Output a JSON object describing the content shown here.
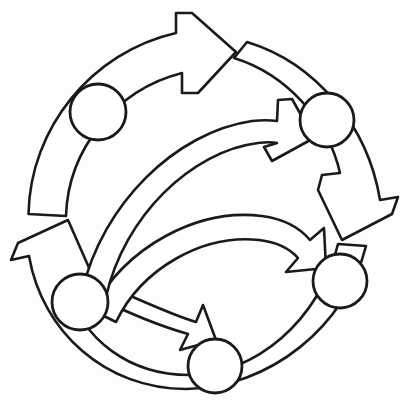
{
  "diagram": {
    "title": "Cyclic process diagram",
    "type": "circular-flow",
    "background_color": "#fdfdfd",
    "stroke_color": "#1a1a1a",
    "fill_color": "#ffffff",
    "stroke_width": 2.6,
    "canvas": {
      "width": 410,
      "height": 420
    },
    "center": {
      "x": 207,
      "y": 208
    },
    "outer_ring": {
      "direction": "clockwise",
      "arrow_count": 3,
      "radius_outer": 180,
      "radius_inner": 143,
      "arrows": [
        {
          "name": "outer-arrow-top",
          "label": "",
          "start_angle_deg": 182,
          "end_angle_deg": 298,
          "head_position": {
            "x": 222,
            "y": 28
          },
          "head_direction": "clockwise-right"
        },
        {
          "name": "outer-arrow-right",
          "label": "",
          "start_angle_deg": 302,
          "end_angle_deg": 58,
          "head_position": {
            "x": 370,
            "y": 188
          },
          "head_direction": "clockwise-down"
        },
        {
          "name": "outer-arrow-bottom",
          "label": "",
          "start_angle_deg": 62,
          "end_angle_deg": 178,
          "head_position": {
            "x": 48,
            "y": 212
          },
          "head_direction": "clockwise-up"
        }
      ]
    },
    "nodes": [
      {
        "name": "node-upper-left",
        "label": "",
        "cx": 98,
        "cy": 112,
        "r": 28
      },
      {
        "name": "node-upper-right",
        "label": "",
        "cx": 327,
        "cy": 120,
        "r": 27
      },
      {
        "name": "node-lower-right",
        "label": "",
        "cx": 340,
        "cy": 281,
        "r": 27
      },
      {
        "name": "node-bottom",
        "label": "",
        "cx": 215,
        "cy": 366,
        "r": 27
      },
      {
        "name": "node-lower-left",
        "label": "",
        "cx": 80,
        "cy": 302,
        "r": 28
      }
    ],
    "inner_arrows": [
      {
        "name": "inner-arrow-upper",
        "label": "",
        "direction": "left-to-right",
        "tail": {
          "x": 88,
          "y": 300
        },
        "head": {
          "x": 276,
          "y": 118
        },
        "head_direction": "up-right"
      },
      {
        "name": "inner-arrow-middle",
        "label": "",
        "direction": "left-to-right",
        "tail": {
          "x": 110,
          "y": 305
        },
        "head": {
          "x": 308,
          "y": 248
        },
        "head_direction": "right"
      },
      {
        "name": "inner-arrow-lower",
        "label": "",
        "direction": "left-to-right",
        "tail": {
          "x": 115,
          "y": 292
        },
        "head": {
          "x": 212,
          "y": 334
        },
        "head_direction": "down-right"
      }
    ]
  }
}
